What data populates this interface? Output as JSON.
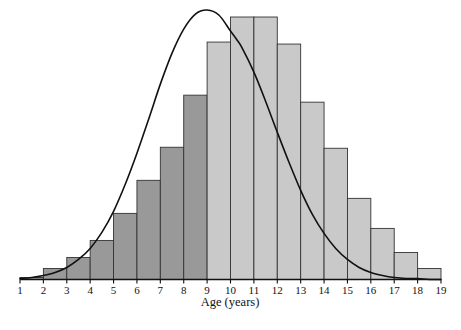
{
  "chart_data": {
    "type": "bar",
    "title": "",
    "subtitle": "",
    "xlabel": "Age (years)",
    "ylabel": "",
    "grid": false,
    "legend": null,
    "xlim": [
      1,
      19
    ],
    "ylim": [
      0,
      262
    ],
    "bin_width": 1,
    "bin_edges": [
      1,
      2,
      3,
      4,
      5,
      6,
      7,
      8,
      9,
      10,
      11,
      12,
      13,
      14,
      15,
      16,
      17,
      18,
      19
    ],
    "categories": [
      "1-2",
      "2-3",
      "3-4",
      "4-5",
      "5-6",
      "6-7",
      "7-8",
      "8-9",
      "9-10",
      "10-11",
      "11-12",
      "12-13",
      "13-14",
      "14-15",
      "15-16",
      "16-17",
      "17-18",
      "18-19"
    ],
    "values": [
      2,
      11,
      22,
      39,
      66,
      99,
      132,
      184,
      237,
      262,
      262,
      235,
      177,
      131,
      81,
      51,
      27,
      11
    ],
    "xticks": [
      1,
      2,
      3,
      4,
      5,
      6,
      7,
      8,
      9,
      10,
      11,
      12,
      13,
      14,
      15,
      16,
      17,
      18,
      19
    ],
    "xtick_labels": [
      "1",
      "2",
      "3",
      "4",
      "5",
      "6",
      "7",
      "8",
      "9",
      "10",
      "11",
      "12",
      "13",
      "14",
      "15",
      "16",
      "17",
      "18",
      "19"
    ],
    "series": [
      {
        "name": "histogram",
        "type": "bar",
        "values": [
          2,
          11,
          22,
          39,
          66,
          99,
          132,
          184,
          237,
          262,
          262,
          235,
          177,
          131,
          81,
          51,
          27,
          11
        ]
      },
      {
        "name": "normal-curve",
        "type": "line",
        "description": "fitted normal density curve overlay",
        "mean": 10.25,
        "std_dev": 2.85,
        "peak_value": 269,
        "x": [
          1.0,
          1.5,
          2.0,
          2.5,
          3.0,
          3.5,
          4.0,
          4.5,
          5.0,
          5.5,
          6.0,
          6.5,
          7.0,
          7.5,
          8.0,
          8.5,
          9.0,
          9.5,
          10.0,
          10.25,
          10.5,
          11.0,
          11.5,
          12.0,
          12.5,
          13.0,
          13.5,
          14.0,
          14.5,
          15.0,
          15.5,
          16.0,
          16.5,
          17.0,
          17.5,
          18.0,
          18.5,
          19.0
        ],
        "y": [
          1,
          2,
          4,
          7,
          12,
          20,
          31,
          47,
          68,
          95,
          126,
          160,
          195,
          226,
          250,
          265,
          269,
          264,
          248,
          240,
          231,
          207,
          178,
          147,
          117,
          89,
          65,
          46,
          31,
          20,
          12,
          7,
          4,
          2,
          1,
          1,
          0,
          0
        ]
      }
    ],
    "bar_shading": {
      "dark_range": [
        1,
        9
      ],
      "light_range": [
        9,
        19
      ],
      "dark_color": "#999999",
      "light_color": "#c9c9c9",
      "edge_color": "#333333"
    },
    "curve_color": "#111111",
    "axis_color": "#111111"
  },
  "axis": {
    "title": "Age (years)"
  }
}
